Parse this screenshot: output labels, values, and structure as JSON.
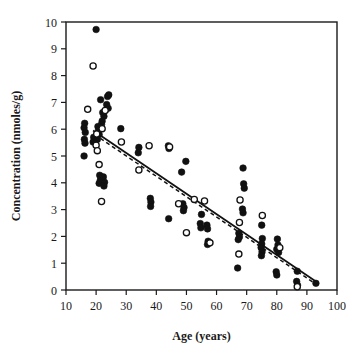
{
  "chart_data": {
    "type": "scatter",
    "title": "",
    "xlabel": "Age (years)",
    "ylabel": "Concentration (nmoles/g)",
    "xlim": [
      10,
      100
    ],
    "ylim": [
      0,
      10
    ],
    "xticks": [
      10,
      20,
      30,
      40,
      50,
      60,
      70,
      80,
      90,
      100
    ],
    "yticks": [
      0,
      1,
      2,
      3,
      4,
      5,
      6,
      7,
      8,
      9,
      10
    ],
    "xtick_labels": [
      "10",
      "20",
      "30",
      "40",
      "50",
      "60",
      "70",
      "80",
      "90",
      "100"
    ],
    "ytick_labels": [
      "0",
      "1",
      "2",
      "3",
      "4",
      "5",
      "6",
      "7",
      "8",
      "9",
      "10"
    ],
    "grid": false,
    "legend": "none",
    "frame": "box",
    "marker_colors": {
      "filled": "#111111",
      "open": "#ffffff",
      "outline": "#111111"
    },
    "series": [
      {
        "name": "filled-circles",
        "marker": "filled-circle",
        "points": [
          [
            20.0,
            9.72
          ],
          [
            21.5,
            7.1
          ],
          [
            23.8,
            7.22
          ],
          [
            24.2,
            7.28
          ],
          [
            23.5,
            6.92
          ],
          [
            24.0,
            6.78
          ],
          [
            22.2,
            6.62
          ],
          [
            22.6,
            6.48
          ],
          [
            22.0,
            6.3
          ],
          [
            21.8,
            6.18
          ],
          [
            16.2,
            6.22
          ],
          [
            16.0,
            6.05
          ],
          [
            16.4,
            5.88
          ],
          [
            16.1,
            5.62
          ],
          [
            16.3,
            5.48
          ],
          [
            16.0,
            5.0
          ],
          [
            20.6,
            6.1
          ],
          [
            20.8,
            5.98
          ],
          [
            21.0,
            5.8
          ],
          [
            20.4,
            5.62
          ],
          [
            19.2,
            5.7
          ],
          [
            19.0,
            5.52
          ],
          [
            21.2,
            4.28
          ],
          [
            21.4,
            4.1
          ],
          [
            21.0,
            3.98
          ],
          [
            22.4,
            4.22
          ],
          [
            22.8,
            4.02
          ],
          [
            22.6,
            3.88
          ],
          [
            28.2,
            6.02
          ],
          [
            34.2,
            5.32
          ],
          [
            34.0,
            5.12
          ],
          [
            38.0,
            3.42
          ],
          [
            38.2,
            3.28
          ],
          [
            38.1,
            3.12
          ],
          [
            44.0,
            5.38
          ],
          [
            44.2,
            5.28
          ],
          [
            44.1,
            2.66
          ],
          [
            48.4,
            4.4
          ],
          [
            49.8,
            4.8
          ],
          [
            48.8,
            3.22
          ],
          [
            49.2,
            3.08
          ],
          [
            49.0,
            2.96
          ],
          [
            55.0,
            2.82
          ],
          [
            54.6,
            2.48
          ],
          [
            54.8,
            2.32
          ],
          [
            56.8,
            2.42
          ],
          [
            57.0,
            2.28
          ],
          [
            57.2,
            1.82
          ],
          [
            57.0,
            1.7
          ],
          [
            67.4,
            2.12
          ],
          [
            67.6,
            1.98
          ],
          [
            67.2,
            1.88
          ],
          [
            67.0,
            0.82
          ],
          [
            68.8,
            4.55
          ],
          [
            69.0,
            3.96
          ],
          [
            69.2,
            3.8
          ],
          [
            68.6,
            3.02
          ],
          [
            68.8,
            2.88
          ],
          [
            75.0,
            2.42
          ],
          [
            75.2,
            1.92
          ],
          [
            75.0,
            1.72
          ],
          [
            74.8,
            1.58
          ],
          [
            75.1,
            1.42
          ],
          [
            74.9,
            1.28
          ],
          [
            80.2,
            1.9
          ],
          [
            80.4,
            1.68
          ],
          [
            80.0,
            1.52
          ],
          [
            80.6,
            1.4
          ],
          [
            79.8,
            0.68
          ],
          [
            80.0,
            0.56
          ],
          [
            86.8,
            0.7
          ],
          [
            86.6,
            0.32
          ],
          [
            86.9,
            0.18
          ],
          [
            93.0,
            0.25
          ]
        ]
      },
      {
        "name": "open-circles",
        "marker": "open-circle",
        "points": [
          [
            19.0,
            8.36
          ],
          [
            17.2,
            6.74
          ],
          [
            23.0,
            6.7
          ],
          [
            22.0,
            6.02
          ],
          [
            20.2,
            5.82
          ],
          [
            20.0,
            5.4
          ],
          [
            20.4,
            5.2
          ],
          [
            21.0,
            4.68
          ],
          [
            21.8,
            3.3
          ],
          [
            28.4,
            5.52
          ],
          [
            34.2,
            4.48
          ],
          [
            37.6,
            5.38
          ],
          [
            44.4,
            5.34
          ],
          [
            47.4,
            3.22
          ],
          [
            50.0,
            2.14
          ],
          [
            52.6,
            3.38
          ],
          [
            56.0,
            3.32
          ],
          [
            57.8,
            1.76
          ],
          [
            67.8,
            3.36
          ],
          [
            67.6,
            2.52
          ],
          [
            67.4,
            1.34
          ],
          [
            75.2,
            2.78
          ],
          [
            81.0,
            1.58
          ],
          [
            86.8,
            0.12
          ]
        ]
      }
    ],
    "fit_lines": [
      {
        "name": "solid-regression-line",
        "style": "solid",
        "x": [
          19.0,
          93.5
        ],
        "y": [
          5.95,
          0.28
        ]
      },
      {
        "name": "dashed-regression-line",
        "style": "dashed",
        "x": [
          19.5,
          93.5
        ],
        "y": [
          5.8,
          0.18
        ]
      }
    ]
  }
}
